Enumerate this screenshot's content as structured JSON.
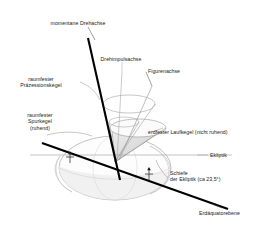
{
  "figure": {
    "language": "de",
    "background": "#ffffff",
    "ink": "#1a1a1a",
    "accent_line": "#000000",
    "thin_line": "#8a8a8a",
    "shade_fill": "#d9d9d9"
  },
  "labels": {
    "instant_axis": "momentane Drehachse",
    "angular_momentum_axis": "Drehimpulsachse",
    "figure_axis": "Figurenachse",
    "space_precession_cone": "raumfester\nPräzessionskegel",
    "space_track_cone": "raumfester\nSpurkegel\n(ruhend)",
    "earth_rolling_cone": "erdfester Laufkegel (nicht ruhend)",
    "ecliptic": "Ekliptik",
    "obliquity": "Schiefe\n    der Ekliptik (ca 23,5°)",
    "equatorial_plane": "Erdäquatorebene"
  },
  "label_lines": {
    "instant_axis_leader": "leader from text to rotation axis",
    "figure_axis_leader": "leader from text to figure axis",
    "ecliptic_leader": "short leader to ecliptic plane line"
  },
  "markers": {
    "tidal_arrow_left": "↑",
    "tidal_arrow_right": "↑",
    "obliquity_value": "23,5°"
  },
  "geometry": {
    "apex": {
      "x": 115,
      "y": 162
    },
    "rotation_axis": {
      "x1": 88,
      "y1": 38,
      "x2": 120,
      "y2": 178
    },
    "ecliptic_line": {
      "x1": 30,
      "y1": 155,
      "x2": 232,
      "y2": 155
    },
    "equator_line": {
      "x1": 42,
      "y1": 143,
      "x2": 226,
      "y2": 208
    },
    "earth_ellipse": {
      "cx": 115,
      "cy": 168,
      "rx": 56,
      "ry": 32
    },
    "upper_cone_rim": {
      "cx": 129,
      "cy": 106,
      "rx": 26,
      "ry": 9
    },
    "lower_cone_rim": {
      "cx": 138,
      "cy": 128,
      "rx": 28,
      "ry": 9
    },
    "small_rim": {
      "cx": 126,
      "cy": 122,
      "rx": 14,
      "ry": 5
    }
  }
}
